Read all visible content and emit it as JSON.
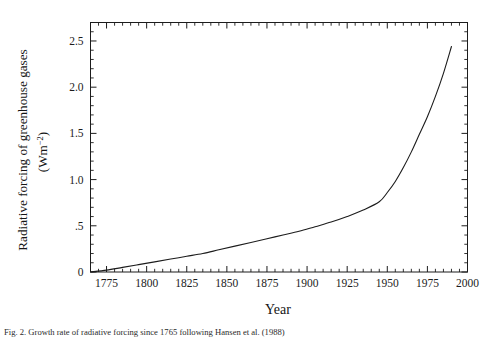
{
  "figure": {
    "caption": "Fig. 2. Growth rate of radiative forcing since 1765 following Hansen et al. (1988)",
    "background_color": "#ffffff",
    "line_color": "#1c1c1c",
    "axis_color": "#1c1c1c"
  },
  "chart_data": {
    "type": "line",
    "title": "",
    "xlabel": "Year",
    "ylabel_line1": "Radiative forcing of greenhouse gases",
    "ylabel_line2": "(Wm",
    "ylabel_exponent": "−2",
    "ylabel_line2_close": ")",
    "xlim": [
      1765,
      2000
    ],
    "ylim": [
      0,
      2.7
    ],
    "grid": false,
    "legend": null,
    "xticks": [
      1775,
      1800,
      1825,
      1850,
      1875,
      1900,
      1925,
      1950,
      1975,
      2000
    ],
    "xticklabels": [
      "1775",
      "1800",
      "1825",
      "1850",
      "1875",
      "1900",
      "1925",
      "1950",
      "1975",
      "2000"
    ],
    "xminor_step": 5,
    "yticks": [
      0,
      0.5,
      1.0,
      1.5,
      2.0,
      2.5
    ],
    "yticklabels": [
      "0",
      ".5",
      "1.0",
      "1.5",
      "2.0",
      "2.5"
    ],
    "yminor_step": 0.1,
    "series": [
      {
        "name": "Radiative forcing of greenhouse gases",
        "x": [
          1765,
          1775,
          1785,
          1795,
          1805,
          1815,
          1825,
          1835,
          1845,
          1855,
          1865,
          1875,
          1885,
          1895,
          1905,
          1915,
          1925,
          1935,
          1945,
          1950,
          1955,
          1960,
          1965,
          1970,
          1975,
          1980,
          1985,
          1990
        ],
        "y": [
          0.0,
          0.02,
          0.05,
          0.08,
          0.11,
          0.14,
          0.17,
          0.2,
          0.24,
          0.28,
          0.32,
          0.36,
          0.4,
          0.44,
          0.49,
          0.54,
          0.6,
          0.67,
          0.76,
          0.86,
          0.98,
          1.13,
          1.3,
          1.49,
          1.68,
          1.9,
          2.15,
          2.44
        ]
      }
    ]
  }
}
